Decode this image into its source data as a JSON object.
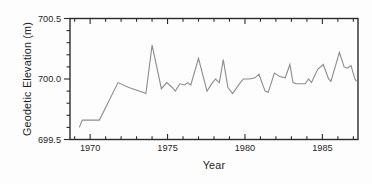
{
  "figure": {
    "background": "#fdfdfd",
    "axis_color": "#2b2b2b",
    "text_color": "#1f1f1f",
    "line_color": "#8c8c8c"
  },
  "chart_data": {
    "type": "line",
    "title": "",
    "xlabel": "Year",
    "ylabel": "Geodetic Elevation (m)",
    "xlim": [
      1968.7,
      1987.3
    ],
    "ylim": [
      699.5,
      700.5
    ],
    "grid": false,
    "legend": null,
    "x_major_ticks": [
      1970,
      1975,
      1980,
      1985
    ],
    "x_tick_labels": [
      "1970",
      "1975",
      "1980",
      "1985"
    ],
    "x_minor_step": 1,
    "y_major_ticks": [
      699.5,
      700.0,
      700.5
    ],
    "y_tick_labels": [
      "699.5",
      "700.0",
      "700.5"
    ],
    "y_minor_step": 0.1,
    "series": [
      {
        "name": "Geodetic elevation",
        "x": [
          1969.3,
          1969.5,
          1970.6,
          1971.8,
          1972.5,
          1973.4,
          1973.6,
          1974.0,
          1974.6,
          1974.95,
          1975.3,
          1975.5,
          1975.8,
          1976.1,
          1976.3,
          1976.5,
          1977.0,
          1977.55,
          1977.9,
          1978.1,
          1978.35,
          1978.6,
          1978.9,
          1979.2,
          1979.7,
          1979.9,
          1980.3,
          1980.65,
          1980.9,
          1981.3,
          1981.5,
          1981.9,
          1982.25,
          1982.6,
          1982.9,
          1983.1,
          1983.3,
          1983.9,
          1984.1,
          1984.3,
          1984.7,
          1985.05,
          1985.4,
          1985.55,
          1986.1,
          1986.4,
          1986.6,
          1986.85,
          1987.1,
          1987.2
        ],
        "y": [
          699.6,
          699.66,
          699.66,
          699.97,
          699.93,
          699.89,
          699.88,
          700.28,
          699.92,
          699.97,
          699.93,
          699.9,
          699.96,
          699.95,
          699.97,
          699.95,
          700.17,
          699.9,
          699.97,
          700.0,
          699.97,
          700.16,
          699.93,
          699.88,
          699.97,
          700.0,
          700.0,
          700.01,
          700.04,
          699.9,
          699.89,
          700.05,
          700.02,
          700.01,
          700.12,
          699.97,
          699.96,
          699.96,
          700.0,
          699.97,
          700.08,
          700.12,
          700.0,
          699.98,
          700.22,
          700.1,
          700.09,
          700.11,
          700.0,
          699.98
        ]
      }
    ]
  }
}
